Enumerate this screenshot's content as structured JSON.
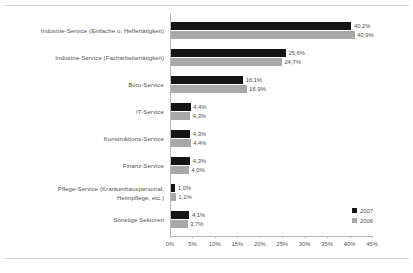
{
  "chart_data": {
    "type": "bar",
    "orientation": "horizontal",
    "title": "",
    "xlabel": "",
    "ylabel": "",
    "xlim": [
      0,
      50
    ],
    "grid": false,
    "legend_position": "bottom-right",
    "categories": [
      "Industrie-Service (Einfache u. Helfertätigkeit)",
      "Industrie-Service (Facharbeitertätigkeit)",
      "Büro-Service",
      "IT-Service",
      "Konstruktions-Service",
      "Finanz-Service",
      "Pflege-Service (Krankenhauspersonal,\nHeimpflege, etc.)",
      "Sonstige Sektoren"
    ],
    "tick_labels": [
      "0%",
      "5%",
      "10%",
      "15%",
      "20%",
      "25%",
      "30%",
      "35%",
      "40%",
      "45%"
    ],
    "tick_values": [
      0,
      5,
      10,
      15,
      20,
      25,
      30,
      35,
      40,
      45
    ],
    "series": [
      {
        "name": "2007",
        "color": "#141414",
        "values": [
          40.2,
          25.6,
          16.1,
          4.4,
          4.3,
          4.3,
          1.0,
          4.1
        ],
        "labels": [
          "40,2%",
          "25,6%",
          "16,1%",
          "4,4%",
          "4,3%",
          "4,3%",
          "1,0%",
          "4,1%"
        ]
      },
      {
        "name": "2006",
        "color": "#a8a8a8",
        "values": [
          40.9,
          24.7,
          16.9,
          4.3,
          4.4,
          4.0,
          1.1,
          3.7
        ],
        "labels": [
          "40,9%",
          "24,7%",
          "16,9%",
          "4,3%",
          "4,4%",
          "4,0%",
          "1,1%",
          "3,7%"
        ]
      }
    ]
  }
}
